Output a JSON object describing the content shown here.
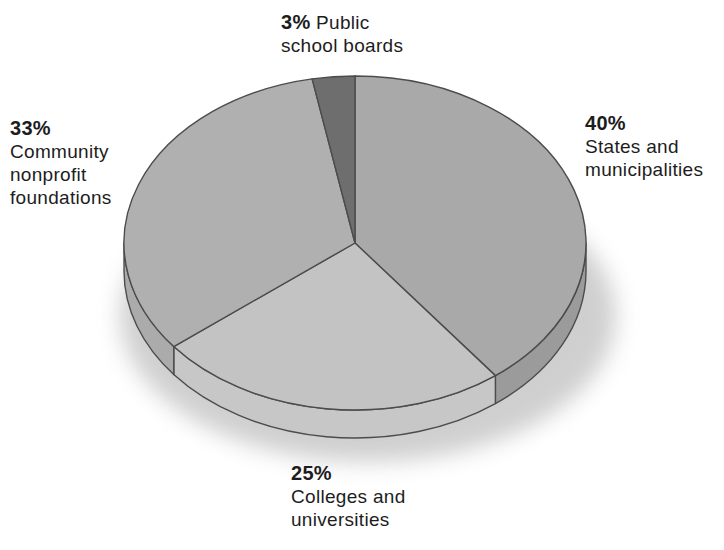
{
  "page": {
    "background_color": "#ffffff"
  },
  "chart_data": {
    "type": "pie",
    "style": "3d-exploded-none",
    "legend": "none",
    "grid": "off",
    "direction": "clockwise",
    "start_angle": "12-oclock",
    "text_color": "#1d1d1d",
    "outline_color": "#4c4c4c",
    "shadow_color": "#c7c7c7",
    "slices": [
      {
        "label": "States and municipalities",
        "pct_label": "40%",
        "value": 40,
        "label_lines": [
          "States and",
          "municipalities"
        ],
        "color": "#a9a9a9",
        "side_color": "#9b9b9b"
      },
      {
        "label": "Colleges and universities",
        "pct_label": "25%",
        "value": 25,
        "label_lines": [
          "Colleges and",
          "universities"
        ],
        "color": "#c3c3c3",
        "side_color": "#c7c7c7"
      },
      {
        "label": "Community nonprofit foundations",
        "pct_label": "33%",
        "value": 33,
        "label_lines": [
          "Community",
          "nonprofit",
          "foundations"
        ],
        "color": "#b0b0b0",
        "side_color": "#ababab"
      },
      {
        "label": "Public school boards",
        "pct_label": "3%",
        "value": 3,
        "label_lines": [
          "Public",
          "school boards"
        ],
        "color": "#6e6e6e",
        "side_color": "#6e6e6e"
      }
    ]
  }
}
